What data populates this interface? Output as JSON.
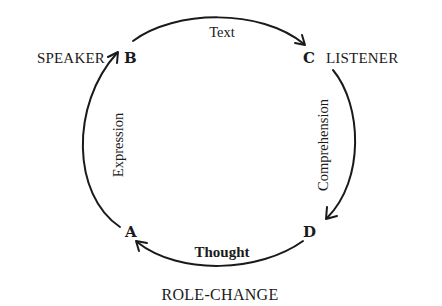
{
  "diagram": {
    "type": "communication-cycle",
    "nodes": {
      "A": {
        "letter": "A",
        "role": ""
      },
      "B": {
        "letter": "B",
        "role": "SPEAKER"
      },
      "C": {
        "letter": "C",
        "role": "LISTENER"
      },
      "D": {
        "letter": "D",
        "role": ""
      }
    },
    "edges": [
      {
        "from": "A",
        "to": "B",
        "label": "Expression"
      },
      {
        "from": "B",
        "to": "C",
        "label": "Text"
      },
      {
        "from": "C",
        "to": "D",
        "label": "Comprehension"
      },
      {
        "from": "D",
        "to": "A",
        "label": "Thought"
      }
    ],
    "caption": "ROLE-CHANGE"
  }
}
